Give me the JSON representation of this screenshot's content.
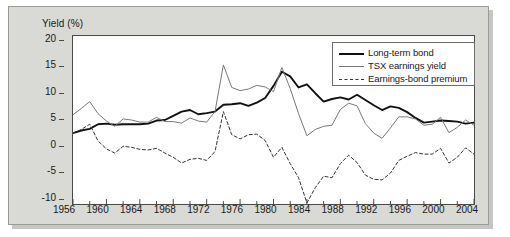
{
  "figure": {
    "ylabel": "Yield (%)",
    "panel_color": "#d9d9d6",
    "plot_background": "#ffffff"
  },
  "legend": {
    "position": "top-right",
    "items": [
      {
        "label": "Long-term bond",
        "style": "solid-thick",
        "color": "#111111"
      },
      {
        "label": "TSX earnings yield",
        "style": "solid-thin",
        "color": "#777775"
      },
      {
        "label": "Earnings-bond premium",
        "style": "dashed",
        "color": "#333333"
      }
    ]
  },
  "chart_data": {
    "type": "line",
    "title": "",
    "subtitle": "",
    "xlabel": "",
    "ylabel": "Yield (%)",
    "xlim": [
      1956,
      2004
    ],
    "ylim": [
      -10,
      22
    ],
    "grid": false,
    "legend_position": "top-right",
    "xticks": [
      1956,
      1960,
      1964,
      1968,
      1972,
      1976,
      1980,
      1984,
      1988,
      1992,
      1996,
      2000,
      2004
    ],
    "xtick_labels": [
      "1956",
      "1960",
      "1964",
      "1968",
      "1972",
      "1976",
      "1980",
      "1984",
      "1988",
      "1992",
      "1996",
      "2000",
      "2004"
    ],
    "xminor_tick_interval": 2,
    "yticks": [
      20,
      15,
      10,
      5,
      0,
      -5,
      -10
    ],
    "ytick_labels": [
      "20",
      "15",
      "10",
      "5",
      "0",
      "-5",
      "-10"
    ],
    "x": [
      1956,
      1957,
      1958,
      1959,
      1960,
      1961,
      1962,
      1963,
      1964,
      1965,
      1966,
      1967,
      1968,
      1969,
      1970,
      1971,
      1972,
      1973,
      1974,
      1975,
      1976,
      1977,
      1978,
      1979,
      1980,
      1981,
      1982,
      1983,
      1984,
      1985,
      1986,
      1987,
      1988,
      1989,
      1990,
      1991,
      1992,
      1993,
      1994,
      1995,
      1996,
      1997,
      1998,
      1999,
      2000,
      2001,
      2002,
      2003,
      2004
    ],
    "series": [
      {
        "name": "Long-term bond",
        "style": "solid-thick",
        "color": "#111111",
        "values": [
          3.5,
          4.0,
          4.3,
          5.2,
          5.3,
          5.1,
          5.2,
          5.2,
          5.2,
          5.3,
          5.9,
          6.0,
          6.8,
          7.6,
          7.9,
          7.1,
          7.3,
          7.6,
          8.9,
          9.0,
          9.2,
          8.7,
          9.3,
          10.2,
          12.5,
          15.2,
          14.3,
          12.2,
          12.8,
          11.1,
          9.5,
          10.0,
          10.3,
          9.9,
          10.8,
          9.8,
          8.8,
          7.9,
          8.6,
          8.3,
          7.5,
          6.4,
          5.5,
          5.7,
          5.9,
          5.8,
          5.7,
          5.3,
          5.5
        ]
      },
      {
        "name": "TSX earnings yield",
        "style": "solid-thin",
        "color": "#777775",
        "values": [
          7.0,
          8.2,
          9.5,
          7.2,
          5.8,
          4.8,
          6.2,
          6.0,
          5.6,
          5.6,
          6.5,
          5.7,
          5.7,
          5.4,
          6.4,
          5.8,
          5.6,
          7.6,
          16.5,
          12.2,
          11.6,
          11.9,
          12.6,
          12.3,
          11.4,
          16.0,
          12.0,
          7.2,
          3.0,
          4.2,
          4.8,
          5.0,
          8.0,
          9.2,
          8.7,
          5.3,
          3.5,
          2.5,
          4.5,
          6.6,
          6.6,
          6.2,
          5.0,
          5.2,
          6.5,
          3.6,
          4.6,
          6.0,
          5.0
        ]
      },
      {
        "name": "Earnings-bond premium",
        "style": "dashed",
        "color": "#333333",
        "values": [
          3.5,
          4.2,
          5.2,
          2.0,
          0.5,
          -0.3,
          1.0,
          0.8,
          0.4,
          0.3,
          0.6,
          -0.3,
          -1.1,
          -2.2,
          -1.5,
          -1.3,
          -1.7,
          0.0,
          7.6,
          3.2,
          2.4,
          3.2,
          3.3,
          2.1,
          -1.1,
          0.8,
          -2.3,
          -5.0,
          -9.8,
          -6.9,
          -4.7,
          -5.0,
          -2.3,
          -0.7,
          -2.1,
          -4.5,
          -5.3,
          -5.4,
          -4.1,
          -1.7,
          -0.9,
          -0.2,
          -0.5,
          -0.5,
          0.6,
          -2.2,
          -1.1,
          0.7,
          -0.5
        ]
      }
    ]
  }
}
